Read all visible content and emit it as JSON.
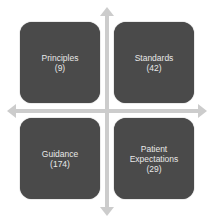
{
  "diagram": {
    "quadrants": [
      {
        "position": "top-left",
        "label": "Principles",
        "count": "(9)"
      },
      {
        "position": "top-right",
        "label": "Standards",
        "count": "(42)"
      },
      {
        "position": "bottom-left",
        "label": "Guidance",
        "count": "(174)"
      },
      {
        "position": "bottom-right",
        "label_line1": "Patient",
        "label_line2": "Expectations",
        "count": "(29)"
      }
    ],
    "colors": {
      "box": "#4a4a4a",
      "text": "#e8e8e8",
      "arrow": "#c8c8c8"
    }
  }
}
